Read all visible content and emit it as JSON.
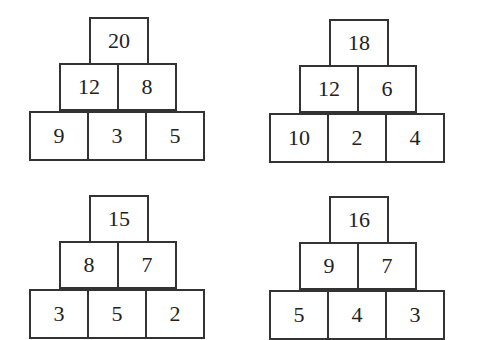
{
  "pyramids": [
    {
      "rows": [
        [
          "20"
        ],
        [
          "12",
          "8"
        ],
        [
          "9",
          "3",
          "5"
        ]
      ]
    },
    {
      "rows": [
        [
          "18"
        ],
        [
          "12",
          "6"
        ],
        [
          "10",
          "2",
          "4"
        ]
      ]
    },
    {
      "rows": [
        [
          "15"
        ],
        [
          "8",
          "7"
        ],
        [
          "3",
          "5",
          "2"
        ]
      ]
    },
    {
      "rows": [
        [
          "16"
        ],
        [
          "9",
          "7"
        ],
        [
          "5",
          "4",
          "3"
        ]
      ]
    }
  ]
}
